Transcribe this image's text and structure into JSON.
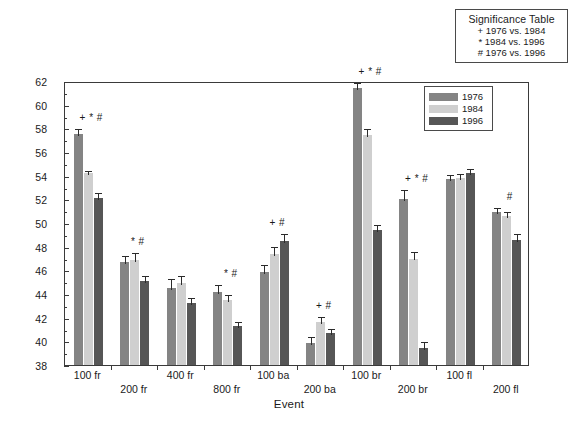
{
  "significance_table": {
    "title": "Significance Table",
    "rows": [
      "+ 1976 vs. 1984",
      "* 1984 vs. 1996",
      "# 1976 vs. 1996"
    ]
  },
  "legend": {
    "entries": [
      {
        "label": "1976",
        "color": "#848484"
      },
      {
        "label": "1984",
        "color": "#cfcfcf"
      },
      {
        "label": "1996",
        "color": "#565656"
      }
    ]
  },
  "axes": {
    "ylabel": "Stroke Rate (cyc/min)",
    "xlabel": "Event",
    "yticks": [
      "38",
      "40",
      "42",
      "44",
      "46",
      "48",
      "50",
      "52",
      "54",
      "56",
      "58",
      "60",
      "62"
    ]
  },
  "chart_data": {
    "type": "bar",
    "title": "",
    "xlabel": "Event",
    "ylabel": "Stroke Rate (cyc/min)",
    "ylim": [
      38,
      62
    ],
    "ytick_step": 2,
    "grid": false,
    "legend_position": "top-right",
    "categories": [
      "100 fr",
      "200 fr",
      "400 fr",
      "800 fr",
      "100 ba",
      "200 ba",
      "100 br",
      "200 br",
      "100 fl",
      "200 fl"
    ],
    "series": [
      {
        "name": "1976",
        "color": "#848484",
        "values": [
          57.5,
          46.7,
          44.5,
          44.2,
          45.9,
          39.9,
          61.4,
          52.0,
          53.7,
          50.9
        ],
        "errors": [
          0.6,
          0.7,
          0.9,
          0.7,
          0.7,
          0.6,
          0.6,
          1.0,
          0.5,
          0.5
        ]
      },
      {
        "name": "1984",
        "color": "#cfcfcf",
        "values": [
          54.2,
          46.9,
          44.9,
          43.5,
          47.4,
          41.6,
          57.4,
          47.0,
          53.8,
          50.6
        ],
        "errors": [
          0.4,
          0.7,
          0.8,
          0.6,
          0.7,
          0.6,
          0.7,
          0.7,
          0.5,
          0.5
        ]
      },
      {
        "name": "1996",
        "color": "#565656",
        "values": [
          52.1,
          45.1,
          43.2,
          41.3,
          48.5,
          40.7,
          49.4,
          39.4,
          54.2,
          48.6
        ],
        "errors": [
          0.6,
          0.6,
          0.6,
          0.5,
          0.7,
          0.5,
          0.6,
          0.7,
          0.5,
          0.6
        ]
      }
    ],
    "annotations": [
      {
        "category": "100 fr",
        "text": "+ * #"
      },
      {
        "category": "200 fr",
        "text": "* #"
      },
      {
        "category": "400 fr",
        "text": ""
      },
      {
        "category": "800 fr",
        "text": "* #"
      },
      {
        "category": "100 ba",
        "text": "+ #"
      },
      {
        "category": "200 ba",
        "text": "+ #"
      },
      {
        "category": "100 br",
        "text": "+ * #"
      },
      {
        "category": "200 br",
        "text": "+ * #"
      },
      {
        "category": "100 fl",
        "text": ""
      },
      {
        "category": "200 fl",
        "text": "#"
      }
    ]
  }
}
